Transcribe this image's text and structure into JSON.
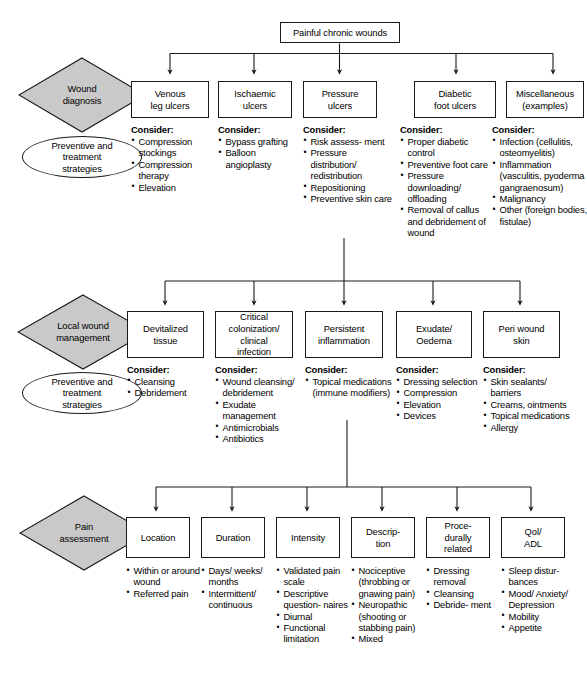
{
  "figure": {
    "title": "Painful chronic wounds",
    "root_box": "Painful chronic wounds",
    "colors": {
      "diamond_fill": "#c9c9c9",
      "line": "#1a1a1a",
      "box_fill": "#ffffff",
      "text": "#000000"
    },
    "consider_label": "Consider:",
    "bottom_caption": ""
  },
  "sections": [
    {
      "id": "wound-diagnosis",
      "diamond": "Wound\ndiagnosis",
      "oval": "Preventive and\ntreatment\nstrategies",
      "columns": [
        {
          "title": "Venous\nleg ulcers",
          "consider": [
            "Compression\nstockings",
            "Compression\ntherapy",
            "Elevation"
          ]
        },
        {
          "title": "Ischaemic\nulcers",
          "consider": [
            "Bypass\ngrafting",
            "Balloon\nangioplasty"
          ]
        },
        {
          "title": "Pressure\nulcers",
          "consider": [
            "Risk assess-\nment",
            "Pressure\ndistribution/\nredistribution",
            "Repositioning",
            "Preventive\nskin care"
          ]
        },
        {
          "title": "Diabetic\nfoot ulcers",
          "consider": [
            "Proper diabetic\ncontrol",
            "Preventive\nfoot care",
            "Pressure\ndownloading/\noffloading",
            "Removal of\ncallus and\ndebridement\nof wound"
          ]
        },
        {
          "title": "Miscellaneous\n(examples)",
          "consider": [
            "Infection\n(cellulitis,\nosteomyelitis)",
            "Inflammation\n(vasculitis,\npyoderma\ngangraenosum)",
            "Malignancy",
            "Other (foreign\nbodies, fistulae)"
          ]
        }
      ]
    },
    {
      "id": "local-wound-management",
      "diamond": "Local wound\nmanagement",
      "oval": "Preventive and\ntreatment\nstrategies",
      "columns": [
        {
          "title": "Devitalized\ntissue",
          "consider": [
            "Cleansing",
            "Debridement"
          ]
        },
        {
          "title": "Critical\ncolonization/\nclinical\ninfection",
          "consider": [
            "Wound\ncleansing/\ndebridement",
            "Exudate\nmanagement",
            "Antimicrobials",
            "Antibiotics"
          ]
        },
        {
          "title": "Persistent\ninflammation",
          "consider": [
            "Topical\nmedications\n(immune\nmodifiers)"
          ]
        },
        {
          "title": "Exudate/\nOedema",
          "consider": [
            "Dressing\nselection",
            "Compression",
            "Elevation",
            "Devices"
          ]
        },
        {
          "title": "Peri wound\nskin",
          "consider": [
            "Skin sealants/\nbarriers",
            "Creams,\nointments",
            "Topical\nmedications",
            "Allergy"
          ]
        }
      ]
    },
    {
      "id": "pain-assessment",
      "diamond": "Pain\nassessment",
      "oval": "",
      "columns": [
        {
          "title": "Location",
          "consider": [
            "Within or\naround\nwound",
            "Referred\npain"
          ]
        },
        {
          "title": "Duration",
          "consider": [
            "Days/\nweeks/\nmonths",
            "Intermittent/\ncontinuous"
          ]
        },
        {
          "title": "Intensity",
          "consider": [
            "Validated\npain scale",
            "Descriptive\nquestion-\nnaires",
            "Diurnal",
            "Functional\nlimitation"
          ]
        },
        {
          "title": "Descrip-\ntion",
          "consider": [
            "Nociceptive\n(throbbing\nor gnawing\npain)",
            "Neuropathic\n(shooting or\nstabbing\npain)",
            "Mixed"
          ]
        },
        {
          "title": "Proce-\ndurally\nrelated",
          "consider": [
            "Dressing\nremoval",
            "Cleansing",
            "Debride-\nment"
          ]
        },
        {
          "title": "Qol/\nADL",
          "consider": [
            "Sleep\ndistur-\nbances",
            "Mood/\nAnxiety/\nDepression",
            "Mobility",
            "Appetite"
          ]
        }
      ]
    }
  ]
}
